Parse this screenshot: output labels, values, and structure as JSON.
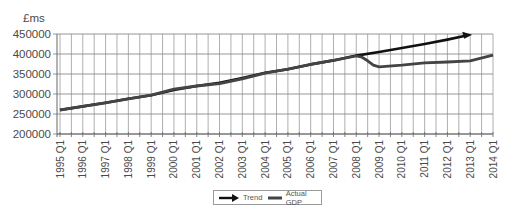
{
  "chart_data": {
    "type": "line",
    "title": "",
    "ylabel": "£ms",
    "xlabel": "",
    "ylim": [
      200000,
      450000
    ],
    "yticks": [
      200000,
      250000,
      300000,
      350000,
      400000,
      450000
    ],
    "ytick_labels": [
      "200000",
      "250000",
      "300000",
      "350000",
      "400000",
      "450000"
    ],
    "grid": true,
    "legend_position": "bottom",
    "x": [
      "1995 Q1",
      "1996 Q1",
      "1997 Q1",
      "1998 Q1",
      "1999 Q1",
      "2000 Q1",
      "2001 Q1",
      "2002 Q1",
      "2003 Q1",
      "2004 Q1",
      "2005 Q1",
      "2006 Q1",
      "2007 Q1",
      "2008 Q1",
      "2009 Q1",
      "2010 Q1",
      "2011 Q1",
      "2012 Q1",
      "2013 Q1",
      "2014 Q1"
    ],
    "series": [
      {
        "name": "Trend",
        "style": "arrow",
        "color": "#111111",
        "values": [
          260000,
          269000,
          278000,
          288000,
          297000,
          310000,
          320000,
          328000,
          340000,
          353000,
          362000,
          374000,
          384000,
          396000,
          405000,
          415000,
          425000,
          436000,
          448000,
          null
        ]
      },
      {
        "name": "Actual GDP",
        "style": "line",
        "color": "#444444",
        "values": [
          260000,
          269000,
          278000,
          288000,
          297000,
          312000,
          320000,
          326000,
          338000,
          352000,
          362000,
          374000,
          384000,
          395000,
          368000,
          372000,
          378000,
          380000,
          383000,
          397000
        ]
      }
    ]
  },
  "legend": {
    "items": [
      {
        "label": "Trend"
      },
      {
        "label": "Actual GDP"
      }
    ]
  }
}
